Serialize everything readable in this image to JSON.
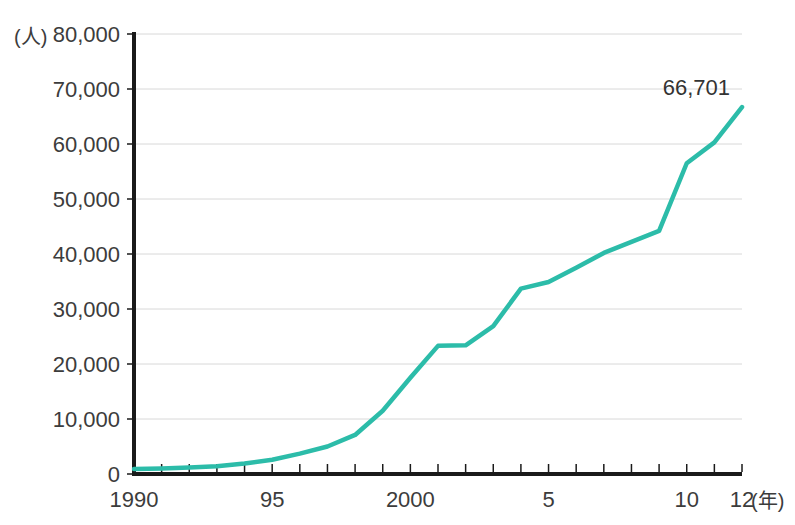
{
  "chart_data": {
    "type": "line",
    "title": "",
    "subtitle": "",
    "xlabel": "(年)",
    "ylabel": "(人)",
    "unit_y": "(人)",
    "unit_x": "(年)",
    "grid": true,
    "legend": "none",
    "xlim": [
      1990,
      2012
    ],
    "ylim": [
      0,
      80000
    ],
    "y_ticks": [
      0,
      10000,
      20000,
      30000,
      40000,
      50000,
      60000,
      70000,
      80000
    ],
    "y_tick_labels": [
      "0",
      "10,000",
      "20,000",
      "30,000",
      "40,000",
      "50,000",
      "60,000",
      "70,000",
      "80,000"
    ],
    "x_ticks": [
      1990,
      1991,
      1992,
      1993,
      1994,
      1995,
      1996,
      1997,
      1998,
      1999,
      2000,
      2001,
      2002,
      2003,
      2004,
      2005,
      2006,
      2007,
      2008,
      2009,
      2010,
      2011,
      2012
    ],
    "x_tick_labels_shown": [
      {
        "x": 1990,
        "label": "1990"
      },
      {
        "x": 1995,
        "label": "95"
      },
      {
        "x": 2000,
        "label": "2000"
      },
      {
        "x": 2005,
        "label": "5"
      },
      {
        "x": 2010,
        "label": "10"
      },
      {
        "x": 2012,
        "label": "12"
      }
    ],
    "x": [
      1990,
      1991,
      1992,
      1993,
      1994,
      1995,
      1996,
      1997,
      1998,
      1999,
      2000,
      2001,
      2002,
      2003,
      2004,
      2005,
      2006,
      2007,
      2008,
      2009,
      2010,
      2011,
      2012
    ],
    "values": [
      900,
      1000,
      1200,
      1400,
      1900,
      2600,
      3700,
      5000,
      7100,
      11500,
      17500,
      23300,
      23400,
      26900,
      33700,
      34900,
      37500,
      40200,
      42200,
      44200,
      56500,
      60300,
      66701
    ],
    "series": [
      {
        "name": "人数",
        "color": "#2CBCA9",
        "values": [
          900,
          1000,
          1200,
          1400,
          1900,
          2600,
          3700,
          5000,
          7100,
          11500,
          17500,
          23300,
          23400,
          26900,
          33700,
          34900,
          37500,
          40200,
          42200,
          44200,
          56500,
          60300,
          66701
        ]
      }
    ],
    "annotations": [
      {
        "x": 2012,
        "y": 66701,
        "text": "66,701",
        "position": "above-left"
      }
    ]
  },
  "style": {
    "line_color": "#2CBCA9",
    "axis_color": "#1a1a1a",
    "grid_color": "#d8d8d8",
    "text_color": "#3c3c3c",
    "background": "#ffffff"
  }
}
